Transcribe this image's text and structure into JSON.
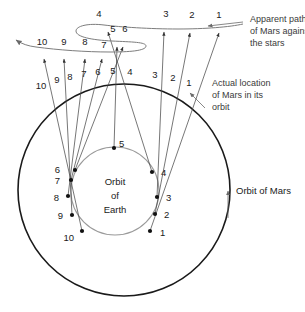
{
  "figure": {
    "type": "diagram",
    "background_color": "#ffffff",
    "colors": {
      "mars_orbit": "#1a1a1a",
      "earth_orbit": "#9a9a9a",
      "sight_line": "#4a4a4a",
      "apparent_path": "#7d7d7d",
      "text": "#1a1a1a",
      "annotation_text": "#3a3a3a"
    }
  },
  "annotations": {
    "apparent_path": "Apparent path\nof Mars against\nthe stars",
    "apparent_path_lines": [
      "Apparent path",
      "of Mars against",
      "the stars"
    ],
    "actual_location": "Actual location\nof Mars in its\norbit",
    "actual_location_lines": [
      "Actual location",
      "of Mars in its",
      "orbit"
    ],
    "orbit_of_mars": "Orbit of Mars",
    "orbit_of_earth_lines": [
      "Orbit",
      "of",
      "Earth"
    ]
  },
  "sky_positions": {
    "description": "Numbered tick marks along the apparent path of Mars against the background stars",
    "labels": [
      "1",
      "2",
      "3",
      "4",
      "5",
      "6",
      "7",
      "8",
      "9",
      "10"
    ],
    "points": [
      {
        "label": "1",
        "x": 219,
        "y": 18,
        "arrow_x": 219,
        "arrow_y": 31
      },
      {
        "label": "2",
        "x": 192,
        "y": 18,
        "arrow_x": 190,
        "arrow_y": 31
      },
      {
        "label": "3",
        "x": 166,
        "y": 17,
        "arrow_x": 164,
        "arrow_y": 30
      },
      {
        "label": "4",
        "x": 99,
        "y": 17,
        "arrow_x": 108,
        "arrow_y": 30
      },
      {
        "label": "5",
        "x": 113,
        "y": 31,
        "arrow_x": 117,
        "arrow_y": 45
      },
      {
        "label": "6",
        "x": 125,
        "y": 31,
        "arrow_x": 123,
        "arrow_y": 45
      },
      {
        "label": "7",
        "x": 105,
        "y": 46,
        "arrow_x": 102,
        "arrow_y": 57
      },
      {
        "label": "8",
        "x": 85,
        "y": 44,
        "arrow_x": 85,
        "arrow_y": 57
      },
      {
        "label": "9",
        "x": 64,
        "y": 44,
        "arrow_x": 64,
        "arrow_y": 57
      },
      {
        "label": "10",
        "x": 42,
        "y": 44,
        "arrow_x": 44,
        "arrow_y": 57
      }
    ]
  },
  "mars_positions": {
    "description": "Numbered actual locations of Mars on its orbit",
    "labels": [
      "1",
      "2",
      "3",
      "4",
      "5",
      "6",
      "7",
      "8",
      "9",
      "10"
    ],
    "points": [
      {
        "label": "1",
        "x": 189,
        "y": 84
      },
      {
        "label": "2",
        "x": 173,
        "y": 80
      },
      {
        "label": "3",
        "x": 155,
        "y": 77
      },
      {
        "label": "4",
        "x": 130,
        "y": 74
      },
      {
        "label": "5",
        "x": 113,
        "y": 73
      },
      {
        "label": "6",
        "x": 98,
        "y": 74
      },
      {
        "label": "7",
        "x": 84,
        "y": 76
      },
      {
        "label": "8",
        "x": 70,
        "y": 79
      },
      {
        "label": "9",
        "x": 57,
        "y": 82
      },
      {
        "label": "10",
        "x": 41,
        "y": 87
      }
    ]
  },
  "earth_positions": {
    "description": "Numbered locations of Earth on its orbit",
    "labels": [
      "1",
      "2",
      "3",
      "4",
      "5",
      "6",
      "7",
      "8",
      "9",
      "10"
    ],
    "points": [
      {
        "label": "1",
        "x": 150,
        "y": 231,
        "lx": 158,
        "ly": 236
      },
      {
        "label": "2",
        "x": 155,
        "y": 214,
        "lx": 163,
        "ly": 218
      },
      {
        "label": "3",
        "x": 157,
        "y": 197,
        "lx": 165,
        "ly": 200
      },
      {
        "label": "4",
        "x": 152,
        "y": 172,
        "lx": 161,
        "ly": 176
      },
      {
        "label": "5",
        "x": 114,
        "y": 148,
        "lx": 120,
        "ly": 146
      },
      {
        "label": "6",
        "x": 75,
        "y": 170,
        "lx": 66,
        "ly": 168
      },
      {
        "label": "7",
        "x": 71,
        "y": 180,
        "lx": 60,
        "ly": 183
      },
      {
        "label": "8",
        "x": 68,
        "y": 196,
        "lx": 57,
        "ly": 200
      },
      {
        "label": "9",
        "x": 72,
        "y": 215,
        "lx": 61,
        "ly": 218
      },
      {
        "label": "10",
        "x": 82,
        "y": 231,
        "lx": 65,
        "ly": 239
      }
    ]
  },
  "orbits": {
    "mars": {
      "cx": 124,
      "cy": 190,
      "r": 106
    },
    "earth": {
      "cx": 115,
      "cy": 191,
      "r": 44
    }
  }
}
